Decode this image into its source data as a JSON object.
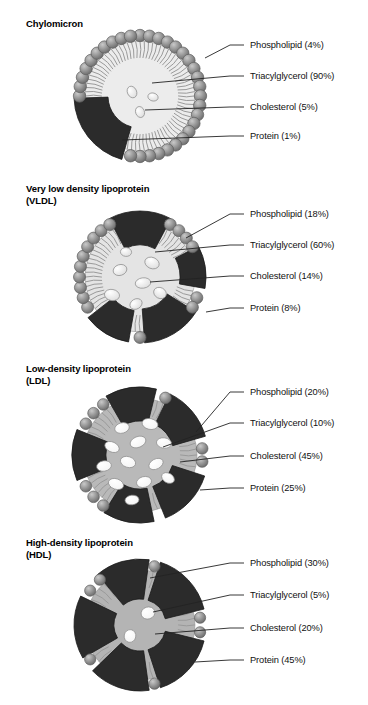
{
  "figure": {
    "background": "#ffffff",
    "panel_count": 4
  },
  "palette": {
    "protein": "#2b2b2b",
    "protein_shade": "#1a1a1a",
    "phospholipid_head": "#8f8f8f",
    "phospholipid_head_dark": "#6a6a6a",
    "phospholipid_head_light": "#c9c9c9",
    "tail": "#9a9a9a",
    "core_light": "#ececec",
    "core_mid": "#b8b8b8",
    "core_dark": "#a8a8a8",
    "cholesterol_light": "#dcdcdc",
    "cholesterol_white": "#f4f4f4",
    "leader_line": "#222222",
    "text": "#111111"
  },
  "panels": [
    {
      "id": "chylomicron",
      "title": "Chylomicron",
      "top": 18,
      "center": {
        "x": 140,
        "y": 96
      },
      "radius": 62,
      "core_fill": "#ececec",
      "head_count": 40,
      "head_radius": 6.2,
      "protein_wedges": [
        {
          "start": 196,
          "end": 268,
          "depth": 30
        }
      ],
      "cholesterol": [
        {
          "x": 132,
          "y": 92,
          "rx": 4.6,
          "ry": 6.0,
          "rot": -25
        },
        {
          "x": 153,
          "y": 97,
          "rx": 5.2,
          "ry": 4.0,
          "rot": 15
        },
        {
          "x": 140,
          "y": 112,
          "rx": 4.4,
          "ry": 5.6,
          "rot": -20
        }
      ],
      "labels": [
        {
          "text": "Phospholipid (4%)",
          "y": 45,
          "anchor": {
            "x": 205,
            "y": 58
          }
        },
        {
          "text": "Triacylglycerol (90%)",
          "y": 76,
          "anchor": {
            "x": 152,
            "y": 83
          }
        },
        {
          "text": "Cholesterol (5%)",
          "y": 107,
          "anchor": {
            "x": 145,
            "y": 110
          }
        },
        {
          "text": "Protein (1%)",
          "y": 136,
          "anchor": {
            "x": 122,
            "y": 140
          }
        }
      ]
    },
    {
      "id": "vldl",
      "title": "Very low density lipoprotein\n(VLDL)",
      "top": 183,
      "center": {
        "x": 140,
        "y": 277
      },
      "radius": 62,
      "core_fill": "#e4e4e4",
      "head_count": 36,
      "head_radius": 6.0,
      "protein_wedges": [
        {
          "start": 122,
          "end": 176,
          "depth": 30
        },
        {
          "start": 332,
          "end": 28,
          "depth": 30
        },
        {
          "start": 190,
          "end": 232,
          "depth": 28
        },
        {
          "start": 62,
          "end": 100,
          "depth": 22
        }
      ],
      "cholesterol": [
        {
          "x": 120,
          "y": 270,
          "rx": 7.0,
          "ry": 5.4,
          "rot": -18
        },
        {
          "x": 152,
          "y": 263,
          "rx": 7.4,
          "ry": 5.6,
          "rot": 22
        },
        {
          "x": 143,
          "y": 283,
          "rx": 7.8,
          "ry": 5.2,
          "rot": -8
        },
        {
          "x": 112,
          "y": 295,
          "rx": 7.6,
          "ry": 5.6,
          "rot": 10
        },
        {
          "x": 136,
          "y": 304,
          "rx": 6.4,
          "ry": 5.0,
          "rot": -30
        },
        {
          "x": 160,
          "y": 293,
          "rx": 6.6,
          "ry": 5.4,
          "rot": 28
        },
        {
          "x": 126,
          "y": 252,
          "rx": 5.6,
          "ry": 4.4,
          "rot": 5
        }
      ],
      "labels": [
        {
          "text": "Phospholipid (18%)",
          "y": 214,
          "anchor": {
            "x": 186,
            "y": 238
          }
        },
        {
          "text": "Triacylglycerol (60%)",
          "y": 245,
          "anchor": {
            "x": 155,
            "y": 252
          }
        },
        {
          "text": "Cholesterol (14%)",
          "y": 276,
          "anchor": {
            "x": 150,
            "y": 282
          }
        },
        {
          "text": "Protein (8%)",
          "y": 308,
          "anchor": {
            "x": 206,
            "y": 312
          }
        }
      ]
    },
    {
      "id": "ldl",
      "title": "Low-density lipoprotein\n(LDL)",
      "top": 363,
      "center": {
        "x": 140,
        "y": 455
      },
      "radius": 64,
      "core_fill": "#b9b9b9",
      "head_count": 30,
      "head_radius": 5.8,
      "protein_wedges": [
        {
          "start": 108,
          "end": 158,
          "depth": 30
        },
        {
          "start": 26,
          "end": 74,
          "depth": 30
        },
        {
          "start": 168,
          "end": 212,
          "depth": 30
        },
        {
          "start": 330,
          "end": 14,
          "depth": 30
        },
        {
          "start": 248,
          "end": 292,
          "depth": 30
        }
      ],
      "cholesterol": [
        {
          "x": 122,
          "y": 428,
          "rx": 7.4,
          "ry": 5.2,
          "rot": -15
        },
        {
          "x": 150,
          "y": 424,
          "rx": 8.0,
          "ry": 5.4,
          "rot": 12
        },
        {
          "x": 112,
          "y": 447,
          "rx": 7.6,
          "ry": 5.0,
          "rot": 25
        },
        {
          "x": 138,
          "y": 442,
          "rx": 8.2,
          "ry": 5.4,
          "rot": -22
        },
        {
          "x": 164,
          "y": 443,
          "rx": 7.6,
          "ry": 5.2,
          "rot": 8
        },
        {
          "x": 104,
          "y": 466,
          "rx": 7.4,
          "ry": 5.2,
          "rot": -10
        },
        {
          "x": 128,
          "y": 462,
          "rx": 7.8,
          "ry": 5.4,
          "rot": 18
        },
        {
          "x": 156,
          "y": 464,
          "rx": 7.6,
          "ry": 5.0,
          "rot": -28
        },
        {
          "x": 116,
          "y": 484,
          "rx": 7.8,
          "ry": 5.2,
          "rot": 20
        },
        {
          "x": 144,
          "y": 482,
          "rx": 7.6,
          "ry": 5.4,
          "rot": -14
        },
        {
          "x": 168,
          "y": 478,
          "rx": 6.8,
          "ry": 4.8,
          "rot": 30
        },
        {
          "x": 132,
          "y": 500,
          "rx": 7.0,
          "ry": 4.8,
          "rot": -6
        }
      ],
      "labels": [
        {
          "text": "Phospholipid (20%)",
          "y": 392,
          "anchor": {
            "x": 196,
            "y": 432
          }
        },
        {
          "text": "Triacylglycerol (10%)",
          "y": 423,
          "anchor": {
            "x": 163,
            "y": 447
          }
        },
        {
          "text": "Cholesterol (45%)",
          "y": 456,
          "anchor": {
            "x": 180,
            "y": 462
          }
        },
        {
          "text": "Protein (25%)",
          "y": 488,
          "anchor": {
            "x": 200,
            "y": 490
          }
        }
      ]
    },
    {
      "id": "hdl",
      "title": "High-density lipoprotein\n(HDL)",
      "top": 537,
      "center": {
        "x": 140,
        "y": 625
      },
      "radius": 62,
      "core_fill": "#b4b4b4",
      "head_count": 26,
      "head_radius": 5.6,
      "protein_wedges": [
        {
          "start": 104,
          "end": 162,
          "depth": 36
        },
        {
          "start": 18,
          "end": 76,
          "depth": 36
        },
        {
          "start": 172,
          "end": 226,
          "depth": 36
        },
        {
          "start": 320,
          "end": 8,
          "depth": 36
        },
        {
          "start": 240,
          "end": 296,
          "depth": 36
        }
      ],
      "cholesterol": [
        {
          "x": 148,
          "y": 613,
          "rx": 7.0,
          "ry": 6.0,
          "rot": -18
        },
        {
          "x": 130,
          "y": 636,
          "rx": 5.8,
          "ry": 6.4,
          "rot": 10
        }
      ],
      "labels": [
        {
          "text": "Phospholipid (30%)",
          "y": 563,
          "anchor": {
            "x": 150,
            "y": 578
          }
        },
        {
          "text": "Triacylglycerol (5%)",
          "y": 595,
          "anchor": {
            "x": 153,
            "y": 612
          }
        },
        {
          "text": "Cholesterol (20%)",
          "y": 628,
          "anchor": {
            "x": 155,
            "y": 634
          }
        },
        {
          "text": "Protein (45%)",
          "y": 660,
          "anchor": {
            "x": 195,
            "y": 662
          }
        }
      ]
    }
  ],
  "label_column_x": 250
}
